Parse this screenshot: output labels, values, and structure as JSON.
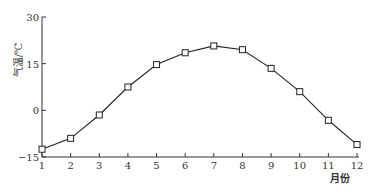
{
  "chart_data": {
    "type": "line",
    "title": "",
    "xlabel": "月份",
    "ylabel": "气温/℃",
    "x": [
      1,
      2,
      3,
      4,
      5,
      6,
      7,
      8,
      9,
      10,
      11,
      12
    ],
    "categories": [
      "1",
      "2",
      "3",
      "4",
      "5",
      "6",
      "7",
      "8",
      "9",
      "10",
      "11",
      "12"
    ],
    "series": [
      {
        "name": "气温",
        "values": [
          -12.5,
          -9,
          -1.5,
          7.5,
          14.7,
          18.5,
          20.7,
          19.5,
          13.5,
          6,
          -3.2,
          -11
        ]
      }
    ],
    "yticks": [
      -15,
      0,
      15,
      30
    ],
    "ytick_labels": [
      "−15",
      "0",
      "15",
      "30"
    ],
    "ylim": [
      -15,
      30
    ],
    "xlim": [
      1,
      12
    ],
    "grid": false,
    "marker": "open-square"
  }
}
